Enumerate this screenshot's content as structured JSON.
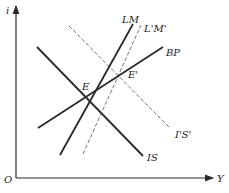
{
  "diagram": {
    "type": "IS-LM-BP",
    "axes": {
      "y_label": "i",
      "x_label": "Y",
      "origin_label": "O"
    },
    "curves": [
      {
        "id": "IS",
        "label": "IS",
        "style": "solid"
      },
      {
        "id": "LM",
        "label": "LM",
        "style": "solid"
      },
      {
        "id": "BP",
        "label": "BP",
        "style": "solid"
      },
      {
        "id": "LpMp",
        "label": "L'M'",
        "style": "dashed"
      },
      {
        "id": "IpSp",
        "label": "I'S'",
        "style": "dashed"
      }
    ],
    "points": [
      {
        "id": "E",
        "label": "E"
      },
      {
        "id": "Ep",
        "label": "E'"
      }
    ],
    "colors": {
      "line": "#2a2a2a",
      "dashed": "#666666",
      "background": "#ffffff"
    }
  }
}
